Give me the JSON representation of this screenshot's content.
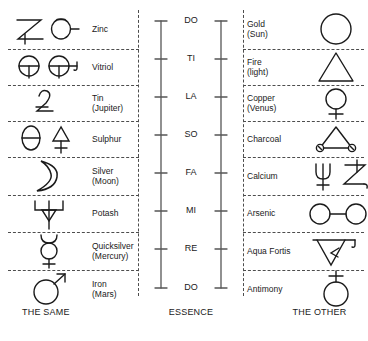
{
  "diagram": {
    "stroke_color": "#1a1a1a",
    "divider_color": "#4d4d4d"
  },
  "columns": {
    "same": {
      "footer": "THE SAME",
      "rows": [
        {
          "label": "Zinc",
          "icon": "zinc-symbol"
        },
        {
          "label": "Vitriol",
          "icon": "vitriol-symbol"
        },
        {
          "label": "Tin\n(Jupiter)",
          "icon": "tin-jupiter-symbol"
        },
        {
          "label": "Sulphur",
          "icon": "sulphur-symbol"
        },
        {
          "label": "Silver\n(Moon)",
          "icon": "silver-moon-symbol"
        },
        {
          "label": "Potash",
          "icon": "potash-symbol"
        },
        {
          "label": "Quicksilver\n(Mercury)",
          "icon": "quicksilver-mercury-symbol"
        },
        {
          "label": "Iron\n(Mars)",
          "icon": "iron-mars-symbol"
        }
      ]
    },
    "essence": {
      "footer": "ESSENCE",
      "notes": [
        "DO",
        "TI",
        "LA",
        "SO",
        "FA",
        "MI",
        "RE",
        "DO"
      ]
    },
    "other": {
      "footer": "THE OTHER",
      "rows": [
        {
          "label": "Gold\n(Sun)",
          "icon": "gold-sun-symbol"
        },
        {
          "label": "Fire\n(light)",
          "icon": "fire-light-symbol"
        },
        {
          "label": "Copper\n(Venus)",
          "icon": "copper-venus-symbol"
        },
        {
          "label": "Charcoal",
          "icon": "charcoal-symbol"
        },
        {
          "label": "Calcium",
          "icon": "calcium-symbol"
        },
        {
          "label": "Arsenic",
          "icon": "arsenic-symbol"
        },
        {
          "label": "Aqua Fortis",
          "icon": "aqua-fortis-symbol"
        },
        {
          "label": "Antimony",
          "icon": "antimony-symbol"
        }
      ]
    }
  }
}
